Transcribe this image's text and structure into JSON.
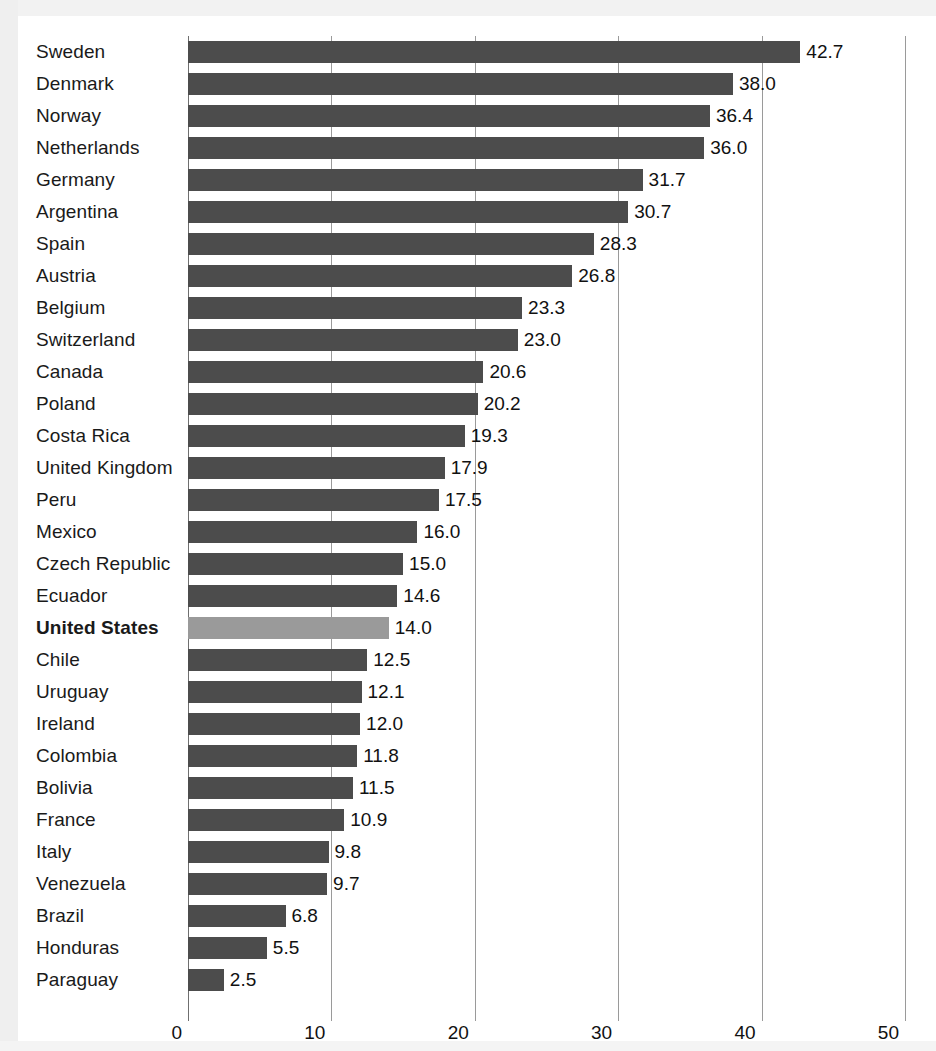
{
  "chart_data": {
    "type": "bar",
    "orientation": "horizontal",
    "title": "",
    "subtitle": "",
    "xlabel": "",
    "ylabel": "",
    "xlim": [
      0,
      50
    ],
    "xticks": [
      0,
      10,
      20,
      30,
      40,
      50
    ],
    "xtick_labels": [
      "0",
      "10",
      "20",
      "30",
      "40",
      "50"
    ],
    "grid": true,
    "legend": false,
    "legend_position": "none",
    "value_label_format": "one-decimal",
    "highlight_category": "United States",
    "categories": [
      "Sweden",
      "Denmark",
      "Norway",
      "Netherlands",
      "Germany",
      "Argentina",
      "Spain",
      "Austria",
      "Belgium",
      "Switzerland",
      "Canada",
      "Poland",
      "Costa Rica",
      "United Kingdom",
      "Peru",
      "Mexico",
      "Czech Republic",
      "Ecuador",
      "United States",
      "Chile",
      "Uruguay",
      "Ireland",
      "Colombia",
      "Bolivia",
      "France",
      "Italy",
      "Venezuela",
      "Brazil",
      "Honduras",
      "Paraguay"
    ],
    "values": [
      42.7,
      38.0,
      36.4,
      36.0,
      31.7,
      30.7,
      28.3,
      26.8,
      23.3,
      23.0,
      20.6,
      20.2,
      19.3,
      17.9,
      17.5,
      16.0,
      15.0,
      14.6,
      14.0,
      12.5,
      12.1,
      12.0,
      11.8,
      11.5,
      10.9,
      9.8,
      9.7,
      6.8,
      5.5,
      2.5
    ],
    "value_labels": [
      "42.7",
      "38.0",
      "36.4",
      "36.0",
      "31.7",
      "30.7",
      "28.3",
      "26.8",
      "23.3",
      "23.0",
      "20.6",
      "20.2",
      "19.3",
      "17.9",
      "17.5",
      "16.0",
      "15.0",
      "14.6",
      "14.0",
      "12.5",
      "12.1",
      "12.0",
      "11.8",
      "11.5",
      "10.9",
      "9.8",
      "9.7",
      "6.8",
      "5.5",
      "2.5"
    ],
    "colors": {
      "bar": "#4c4c4c",
      "bar_highlight": "#9a9a9a",
      "gridline": "#9a9a9a",
      "text": "#111111",
      "background": "#ffffff"
    }
  }
}
